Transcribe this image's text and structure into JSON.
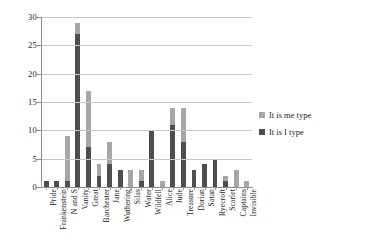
{
  "chart_data": {
    "type": "bar",
    "subtype": "stacked-bar",
    "title": "",
    "xlabel": "",
    "ylabel": "",
    "ylim": [
      0,
      30
    ],
    "ytick_step": 5,
    "yticks": [
      0,
      5,
      10,
      15,
      20,
      25,
      30
    ],
    "grid": true,
    "legend_position": "right",
    "categories": [
      "Pride",
      "Frankenstein",
      "N and S",
      "Vanity",
      "Great",
      "Barchester",
      "Jane",
      "Wuthering",
      "Silas",
      "Water",
      "Wildfell",
      "Alice",
      "Jude",
      "Treasure",
      "Dorian",
      "Satan",
      "Ryecroft",
      "Scarlet",
      "Captains",
      "Invisible"
    ],
    "series": [
      {
        "name": "It is I type",
        "color": "#4e4e4e",
        "values": [
          1,
          1,
          1,
          27,
          7,
          2,
          4,
          3,
          0,
          1,
          10,
          0,
          11,
          8,
          3,
          4,
          5,
          1,
          0,
          0
        ]
      },
      {
        "name": "It is me type",
        "color": "#a6a6a6",
        "values": [
          0,
          0,
          8,
          2,
          10,
          2,
          4,
          0,
          3,
          2,
          0,
          1,
          3,
          6,
          0,
          0,
          0,
          1,
          3,
          1
        ]
      }
    ],
    "totals": [
      1,
      1,
      9,
      29,
      17,
      4,
      8,
      3,
      3,
      3,
      10,
      1,
      14,
      14,
      3,
      4,
      5,
      2,
      3,
      1
    ]
  },
  "legend": {
    "items": [
      {
        "label": "It is me type",
        "color": "#a6a6a6"
      },
      {
        "label": "It is I type",
        "color": "#4e4e4e"
      }
    ]
  }
}
